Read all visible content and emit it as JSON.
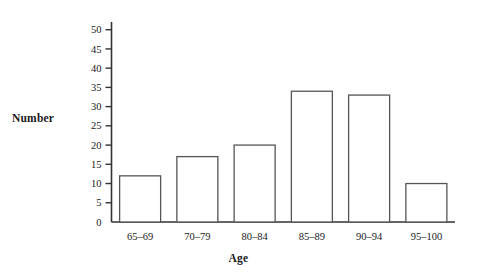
{
  "chart_data": {
    "type": "bar",
    "title": "",
    "subtitle": "",
    "xlabel": "Age",
    "ylabel": "Number",
    "categories": [
      "65–69",
      "70–79",
      "80–84",
      "85–89",
      "90–94",
      "95–100"
    ],
    "values": [
      12,
      17,
      20,
      34,
      33,
      10
    ],
    "series": [
      {
        "name": "Number",
        "values": [
          12,
          17,
          20,
          34,
          33,
          10
        ]
      }
    ],
    "ylim": [
      0,
      52
    ],
    "yticks": [
      0,
      5,
      10,
      15,
      20,
      25,
      30,
      35,
      40,
      45,
      50
    ],
    "ytick_labels": [
      "0",
      "5",
      "10",
      "15",
      "20",
      "25",
      "30",
      "35",
      "40",
      "45",
      "50"
    ],
    "grid": false,
    "legend": false,
    "legend_position": "none",
    "bar_fill_color": "#ffffff",
    "bar_edge_color": "#555555",
    "axis_color": "#333333",
    "background_color": "#ffffff",
    "annotations": []
  }
}
